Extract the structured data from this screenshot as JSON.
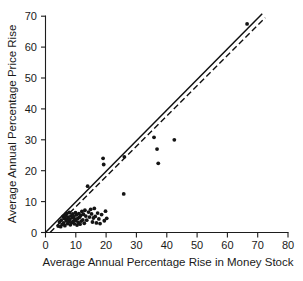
{
  "chart_data": {
    "type": "scatter",
    "title": "",
    "xlabel": "Average Annual Percentage Rise in Money Stock",
    "ylabel": "Average Annual Percentage Price Rise",
    "xlim": [
      0,
      80
    ],
    "ylim": [
      0,
      70
    ],
    "xticks": [
      0,
      10,
      20,
      30,
      40,
      50,
      60,
      70,
      80
    ],
    "yticks": [
      0,
      10,
      20,
      30,
      40,
      50,
      60,
      70
    ],
    "xtick_labels": [
      "0",
      "10",
      "20",
      "30",
      "40",
      "50",
      "60",
      "70",
      "80"
    ],
    "ytick_labels": [
      "0",
      "10",
      "20",
      "30",
      "40",
      "50",
      "60",
      "70"
    ],
    "grid": false,
    "legend": "none",
    "marker": "filled-circle",
    "marker_size": 1.9,
    "series": [
      {
        "name": "Countries",
        "points": [
          [
            4.2,
            2.1
          ],
          [
            4.6,
            3.4
          ],
          [
            5.0,
            1.9
          ],
          [
            5.2,
            4.0
          ],
          [
            5.5,
            2.6
          ],
          [
            5.8,
            5.2
          ],
          [
            6.0,
            3.1
          ],
          [
            6.2,
            4.6
          ],
          [
            6.4,
            2.2
          ],
          [
            6.6,
            5.6
          ],
          [
            6.8,
            3.8
          ],
          [
            7.0,
            4.4
          ],
          [
            7.1,
            6.2
          ],
          [
            7.3,
            2.9
          ],
          [
            7.5,
            5.0
          ],
          [
            7.7,
            3.5
          ],
          [
            7.9,
            6.5
          ],
          [
            8.0,
            4.2
          ],
          [
            8.2,
            2.5
          ],
          [
            8.4,
            5.4
          ],
          [
            8.6,
            3.2
          ],
          [
            8.8,
            4.8
          ],
          [
            9.0,
            6.0
          ],
          [
            9.1,
            3.6
          ],
          [
            9.3,
            5.1
          ],
          [
            9.5,
            2.8
          ],
          [
            9.7,
            4.3
          ],
          [
            9.9,
            6.4
          ],
          [
            10.0,
            3.9
          ],
          [
            10.2,
            5.7
          ],
          [
            10.4,
            2.4
          ],
          [
            10.6,
            4.5
          ],
          [
            10.8,
            3.3
          ],
          [
            11.0,
            6.1
          ],
          [
            11.2,
            4.9
          ],
          [
            11.4,
            2.7
          ],
          [
            11.6,
            5.5
          ],
          [
            11.8,
            3.7
          ],
          [
            12.0,
            6.8
          ],
          [
            12.3,
            4.1
          ],
          [
            12.5,
            5.9
          ],
          [
            12.8,
            3.0
          ],
          [
            13.0,
            7.2
          ],
          [
            13.3,
            5.3
          ],
          [
            13.6,
            4.0
          ],
          [
            13.9,
            15.0
          ],
          [
            14.2,
            6.6
          ],
          [
            14.5,
            5.0
          ],
          [
            14.9,
            7.5
          ],
          [
            15.2,
            6.0
          ],
          [
            15.5,
            3.4
          ],
          [
            15.8,
            4.7
          ],
          [
            16.1,
            7.8
          ],
          [
            16.4,
            5.2
          ],
          [
            16.8,
            3.1
          ],
          [
            17.2,
            6.3
          ],
          [
            17.6,
            4.4
          ],
          [
            18.0,
            2.9
          ],
          [
            18.5,
            5.8
          ],
          [
            19.0,
            24.0
          ],
          [
            19.2,
            22.0
          ],
          [
            19.4,
            3.8
          ],
          [
            19.8,
            6.9
          ],
          [
            20.2,
            4.6
          ],
          [
            25.8,
            12.5
          ],
          [
            26.0,
            24.5
          ],
          [
            35.8,
            30.8
          ],
          [
            36.8,
            27.0
          ],
          [
            37.2,
            22.4
          ],
          [
            42.5,
            30.0
          ],
          [
            66.5,
            67.5
          ]
        ]
      }
    ],
    "reference_lines": [
      {
        "name": "45-degree-line",
        "style": "solid",
        "from": [
          0,
          0
        ],
        "to": [
          71.5,
          70.8
        ]
      },
      {
        "name": "regression-line",
        "style": "dashed",
        "from": [
          1.5,
          0
        ],
        "to": [
          72.5,
          69.5
        ]
      }
    ]
  }
}
